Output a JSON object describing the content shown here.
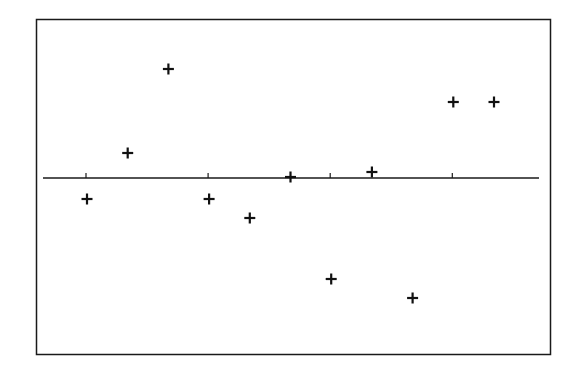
{
  "chart_data": {
    "type": "scatter",
    "title": "",
    "xlabel": "",
    "ylabel": "",
    "marker": "plus",
    "x": [
      1,
      2,
      3,
      4,
      5,
      6,
      7,
      8,
      9,
      10,
      11
    ],
    "values": [
      -2.1,
      2.5,
      10.9,
      -2.1,
      -4.0,
      0.1,
      -10.1,
      0.6,
      -12.0,
      7.6,
      7.6
    ],
    "reference_line_y": 0,
    "x_ticks": [
      1,
      4,
      7,
      10
    ],
    "tick_labels_visible": false,
    "ylim": [
      -17.6,
      15.9
    ],
    "xlim": [
      -0.05,
      12.05
    ],
    "grid": false,
    "legend": null
  },
  "style": {
    "frame_color": "#1a1a1a",
    "marker_color": "#111111",
    "background": "#ffffff"
  }
}
